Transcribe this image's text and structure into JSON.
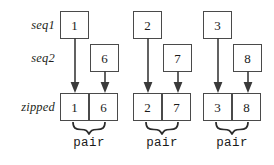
{
  "diagram": {
    "colors": {
      "box_border": "#4a4a4a",
      "arrow": "#3a3a3a",
      "brace": "#2b2b2b",
      "text": "#1a1a1a",
      "background": "#ffffff"
    },
    "row_labels": [
      {
        "id": "seq1",
        "text": "seq1"
      },
      {
        "id": "seq2",
        "text": "seq2"
      },
      {
        "id": "zipped",
        "text": "zipped"
      }
    ],
    "groups": [
      {
        "index": 1,
        "seq1_value": "1",
        "seq2_value": "6",
        "zipped_left_value": "1",
        "zipped_right_value": "6",
        "pair_label": "pair"
      },
      {
        "index": 2,
        "seq1_value": "2",
        "seq2_value": "7",
        "zipped_left_value": "2",
        "zipped_right_value": "7",
        "pair_label": "pair"
      },
      {
        "index": 3,
        "seq1_value": "3",
        "seq2_value": "8",
        "zipped_left_value": "3",
        "zipped_right_value": "8",
        "pair_label": "pair"
      }
    ]
  }
}
